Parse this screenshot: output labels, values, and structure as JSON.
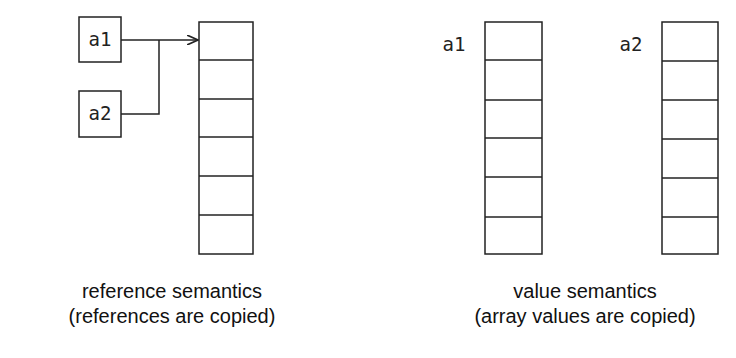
{
  "reference": {
    "var1": "a1",
    "var2": "a2",
    "caption_line1": "reference semantics",
    "caption_line2": "(references are copied)",
    "cells": 6
  },
  "value": {
    "var1": "a1",
    "var2": "a2",
    "caption_line1": "value semantics",
    "caption_line2": "(array values are copied)",
    "cells": 6
  },
  "colors": {
    "stroke": "#222222",
    "background": "#ffffff"
  }
}
